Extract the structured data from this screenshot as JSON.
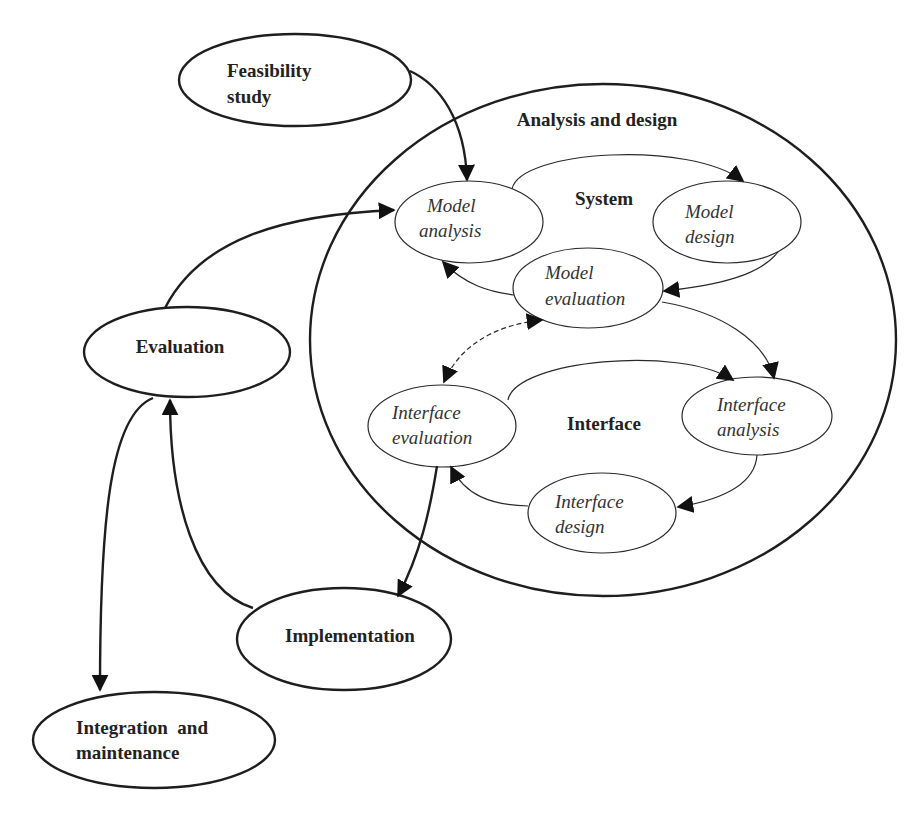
{
  "diagram": {
    "outer_nodes": {
      "feasibility": {
        "line1": "Feasibility",
        "line2": "study"
      },
      "evaluation": {
        "label": "Evaluation"
      },
      "implementation": {
        "label": "Implementation"
      },
      "integration": {
        "line1": "Integration  and",
        "line2": "maintenance"
      }
    },
    "container": {
      "title": "Analysis and design",
      "system_label": "System",
      "interface_label": "Interface"
    },
    "system_nodes": {
      "model_analysis": {
        "line1": "Model",
        "line2": "analysis"
      },
      "model_design": {
        "line1": "Model",
        "line2": "design"
      },
      "model_evaluation": {
        "line1": "Model",
        "line2": "evaluation"
      }
    },
    "interface_nodes": {
      "interface_evaluation": {
        "line1": "Interface",
        "line2": "evaluation"
      },
      "interface_analysis": {
        "line1": "Interface",
        "line2": "analysis"
      },
      "interface_design": {
        "line1": "Interface",
        "line2": "design"
      }
    },
    "edges": [
      {
        "from": "Feasibility study",
        "to": "Model analysis",
        "style": "solid"
      },
      {
        "from": "Evaluation",
        "to": "Model analysis",
        "style": "solid"
      },
      {
        "from": "Model analysis",
        "to": "Model design",
        "style": "solid"
      },
      {
        "from": "Model design",
        "to": "Model evaluation",
        "style": "solid"
      },
      {
        "from": "Model evaluation",
        "to": "Model analysis",
        "style": "solid"
      },
      {
        "from": "Model evaluation",
        "to": "Interface analysis",
        "style": "solid"
      },
      {
        "from": "Model evaluation",
        "to": "Interface evaluation",
        "style": "dashed",
        "bidirectional": true
      },
      {
        "from": "Interface evaluation",
        "to": "Interface analysis",
        "style": "solid"
      },
      {
        "from": "Interface analysis",
        "to": "Interface design",
        "style": "solid"
      },
      {
        "from": "Interface design",
        "to": "Interface evaluation",
        "style": "solid"
      },
      {
        "from": "Interface evaluation",
        "to": "Implementation",
        "style": "solid"
      },
      {
        "from": "Implementation",
        "to": "Evaluation",
        "style": "solid"
      },
      {
        "from": "Evaluation",
        "to": "Integration and maintenance",
        "style": "solid"
      }
    ]
  }
}
